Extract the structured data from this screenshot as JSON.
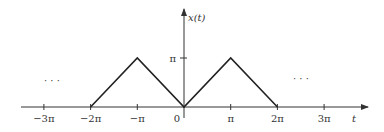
{
  "chart_data": {
    "type": "line",
    "title": "",
    "xlabel": "t",
    "ylabel": "x(t)",
    "x_ticks": [
      {
        "value": -3,
        "label": "−3π"
      },
      {
        "value": -2,
        "label": "−2π"
      },
      {
        "value": -1,
        "label": "−π"
      },
      {
        "value": 0,
        "label": "0"
      },
      {
        "value": 1,
        "label": "π"
      },
      {
        "value": 2,
        "label": "2π"
      },
      {
        "value": 3,
        "label": "3π"
      }
    ],
    "y_ticks": [
      {
        "value": 1,
        "label": "π"
      }
    ],
    "x_unit": "π",
    "y_unit": "π",
    "series": [
      {
        "name": "x(t)",
        "x": [
          -2,
          -1,
          0,
          1,
          2
        ],
        "y": [
          0,
          1,
          0,
          1,
          0
        ]
      }
    ],
    "xlim": [
      -3.5,
      3.9
    ],
    "ylim": [
      -0.2,
      1.9
    ],
    "grid": false,
    "legend": "none",
    "annotations": [
      {
        "text": "· · ·",
        "position": "left",
        "meaning": "pattern continues"
      },
      {
        "text": "· · ·",
        "position": "right",
        "meaning": "pattern continues"
      }
    ]
  },
  "labels": {
    "y_axis": "x(t)",
    "x_axis": "t",
    "origin": "0",
    "y_pi": "π",
    "ellipsis_left": "· · ·",
    "ellipsis_right": "· · ·"
  },
  "colors": {
    "axis": "#333333",
    "line": "#222222",
    "text": "#333333"
  }
}
